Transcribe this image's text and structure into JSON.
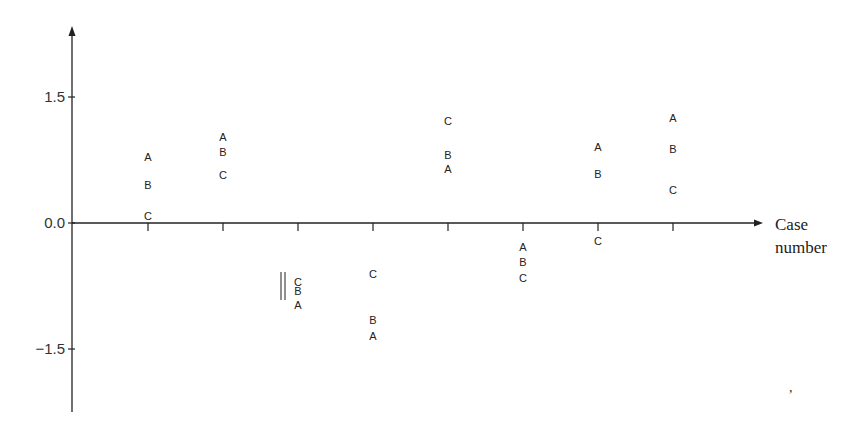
{
  "chart_data": {
    "type": "scatter",
    "title": "",
    "xlabel": "Case number",
    "ylabel": "",
    "yticks": [
      1.5,
      0.0,
      -1.5
    ],
    "ytick_labels": [
      "1.5",
      "0.0",
      "−1.5"
    ],
    "ylim": [
      -2.2,
      2.2
    ],
    "grid": false,
    "legend": null,
    "markers_as_letters": true,
    "categories": [
      1,
      2,
      3,
      4,
      5,
      6,
      7,
      8
    ],
    "series": [
      {
        "name": "A",
        "values": [
          0.79,
          1.02,
          -0.98,
          -1.35,
          0.64,
          -0.29,
          0.9,
          1.25
        ]
      },
      {
        "name": "B",
        "values": [
          0.45,
          0.85,
          -0.81,
          -1.15,
          0.81,
          -0.46,
          0.58,
          0.88
        ]
      },
      {
        "name": "C",
        "values": [
          0.08,
          0.57,
          -0.7,
          -0.61,
          1.21,
          -0.65,
          -0.21,
          0.39
        ]
      }
    ],
    "annotations": [
      {
        "type": "double-vertical-bar",
        "case": 3,
        "note": "marker beside case 3 values"
      }
    ]
  },
  "axis": {
    "x_title_line1": "Case",
    "x_title_line2": "number"
  }
}
